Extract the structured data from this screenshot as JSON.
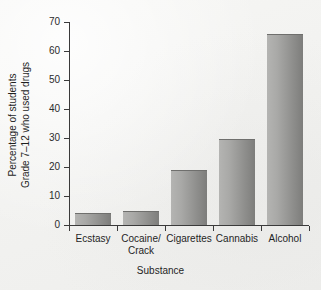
{
  "chart_data": {
    "type": "bar",
    "title": "",
    "categories": [
      "Ecstasy",
      "Cocaine/\nCrack",
      "Cigarettes",
      "Cannabis",
      "Alcohol"
    ],
    "values": [
      4,
      5,
      19,
      29.5,
      66
    ],
    "xlabel": "Substance",
    "ylabel": "Percentage of students\nGrade 7–12 who used drugs",
    "ylim": [
      0,
      70
    ],
    "ytick_labels": [
      "0",
      "10",
      "20",
      "30",
      "40",
      "50",
      "60",
      "70"
    ],
    "ytick_values": [
      0,
      10,
      20,
      30,
      40,
      50,
      60,
      70
    ],
    "grid": false,
    "legend": null,
    "bar_color": "#9a9a98",
    "axis_color": "#3a3a3a",
    "background_color": "#f2f2f0"
  }
}
